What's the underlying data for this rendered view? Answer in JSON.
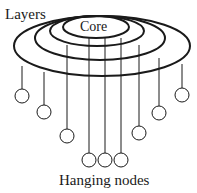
{
  "labels": {
    "layers": "Layers",
    "core": "Core",
    "hanging_nodes": "Hanging nodes"
  },
  "colors": {
    "stroke": "#1a1a1a",
    "background": "#ffffff"
  },
  "layers": [
    {
      "name": "core",
      "cx": 96,
      "cy": 27,
      "rx": 33,
      "ry": 11
    },
    {
      "name": "layer-2",
      "cx": 97,
      "cy": 31,
      "rx": 47,
      "ry": 15
    },
    {
      "name": "layer-3",
      "cx": 100,
      "cy": 38,
      "rx": 65,
      "ry": 22
    },
    {
      "name": "layer-4",
      "cx": 102,
      "cy": 46,
      "rx": 88,
      "ry": 30
    }
  ],
  "hanging_nodes": [
    {
      "x": 22,
      "y_top": 66,
      "cy": 96,
      "r": 7
    },
    {
      "x": 44,
      "y_top": 72,
      "cy": 112,
      "r": 7
    },
    {
      "x": 67,
      "y_top": 45,
      "cy": 136,
      "r": 7
    },
    {
      "x": 89,
      "y_top": 38,
      "cy": 160,
      "r": 7
    },
    {
      "x": 105,
      "y_top": 38,
      "cy": 160,
      "r": 7
    },
    {
      "x": 121,
      "y_top": 38,
      "cy": 160,
      "r": 7
    },
    {
      "x": 139,
      "y_top": 45,
      "cy": 133,
      "r": 7
    },
    {
      "x": 159,
      "y_top": 58,
      "cy": 113,
      "r": 7
    },
    {
      "x": 182,
      "y_top": 64,
      "cy": 95,
      "r": 7
    }
  ]
}
